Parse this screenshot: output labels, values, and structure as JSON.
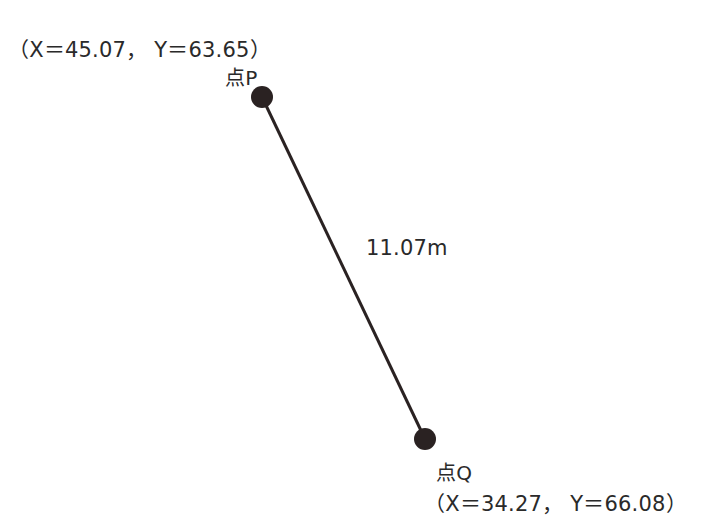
{
  "diagram": {
    "points": [
      {
        "name": "点P",
        "x_label": "X＝45.07",
        "y_label": "Y＝63.65",
        "coord_text": "（X＝45.07，  Y＝63.65）",
        "pos": [
          262,
          97
        ]
      },
      {
        "name": "点Q",
        "x_label": "X＝34.27",
        "y_label": "Y＝66.08",
        "coord_text": "（X＝34.27，  Y＝66.08）",
        "pos": [
          425,
          439
        ]
      }
    ],
    "segment": {
      "from": "点P",
      "to": "点Q",
      "length_label": "11.07m"
    },
    "colors": {
      "line": "#2a2222",
      "point": "#2a2222",
      "text": "#2a2a2a",
      "background": "#ffffff"
    }
  }
}
